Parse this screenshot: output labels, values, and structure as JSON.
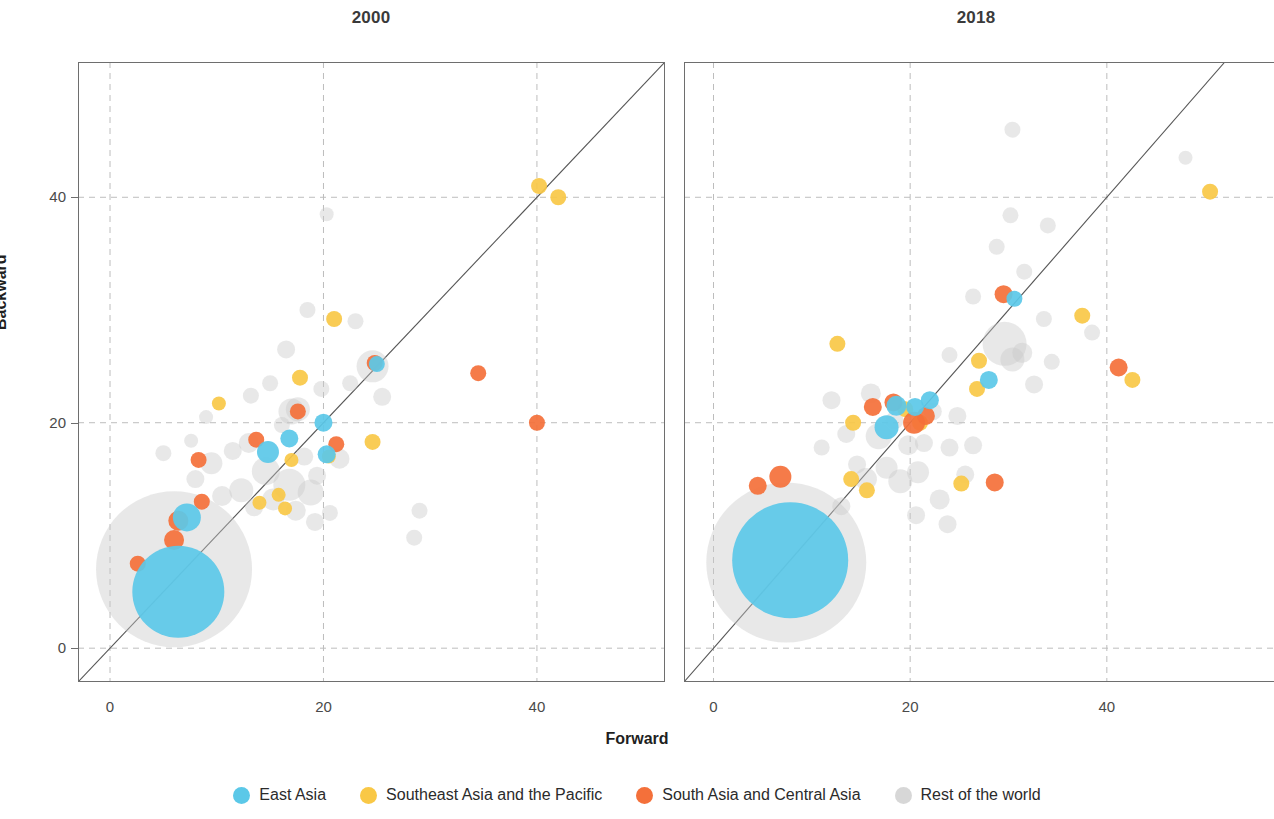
{
  "figure": {
    "xlabel": "Forward",
    "ylabel": "Backward"
  },
  "panels": [
    {
      "key": "p2000",
      "title": "2000"
    },
    {
      "key": "p2018",
      "title": "2018"
    }
  ],
  "legend": {
    "items": [
      {
        "label": "East Asia",
        "color": "#5BC8E8",
        "icon": "circle-marker-icon"
      },
      {
        "label": "Southeast Asia and the Pacific",
        "color": "#F9C846",
        "icon": "circle-marker-icon"
      },
      {
        "label": "South Asia and Central Asia",
        "color": "#F4703A",
        "icon": "circle-marker-icon"
      },
      {
        "label": "Rest of the world",
        "color": "#C9C9C9",
        "icon": "circle-marker-icon"
      }
    ]
  },
  "axis_ticks": {
    "x": [
      "0",
      "20",
      "40"
    ],
    "y": [
      "0",
      "20",
      "40"
    ]
  },
  "chart_data": {
    "type": "scatter",
    "xlabel": "Forward",
    "ylabel": "Backward",
    "grid": true,
    "legend_position": "bottom",
    "marker_encoding": "bubble size = economy size; color = region",
    "reference_line": {
      "type": "identity",
      "equation": "y = x",
      "color": "#555555"
    },
    "colors": {
      "East Asia": "#5BC8E8",
      "Southeast Asia and the Pacific": "#F9C846",
      "South Asia and Central Asia": "#F4703A",
      "Rest of the world": "#C9C9C9"
    },
    "panels": [
      {
        "title": "2000",
        "xlim": [
          -3,
          52
        ],
        "ylim": [
          -3,
          52
        ],
        "xticks": [
          0,
          20,
          40
        ],
        "yticks": [
          0,
          20,
          40
        ],
        "points": [
          {
            "region": "East Asia",
            "x": 6.4,
            "y": 5.0,
            "r": 46
          },
          {
            "region": "East Asia",
            "x": 7.2,
            "y": 11.6,
            "r": 14
          },
          {
            "region": "East Asia",
            "x": 14.8,
            "y": 17.4,
            "r": 11
          },
          {
            "region": "East Asia",
            "x": 16.8,
            "y": 18.6,
            "r": 9
          },
          {
            "region": "East Asia",
            "x": 20.0,
            "y": 20.0,
            "r": 9
          },
          {
            "region": "East Asia",
            "x": 20.3,
            "y": 17.2,
            "r": 9
          },
          {
            "region": "East Asia",
            "x": 25.0,
            "y": 25.2,
            "r": 8
          },
          {
            "region": "Southeast Asia and the Pacific",
            "x": 10.2,
            "y": 21.7,
            "r": 7
          },
          {
            "region": "Southeast Asia and the Pacific",
            "x": 14.0,
            "y": 12.9,
            "r": 7
          },
          {
            "region": "Southeast Asia and the Pacific",
            "x": 15.8,
            "y": 13.6,
            "r": 7
          },
          {
            "region": "Southeast Asia and the Pacific",
            "x": 16.4,
            "y": 12.4,
            "r": 7
          },
          {
            "region": "Southeast Asia and the Pacific",
            "x": 17.0,
            "y": 16.7,
            "r": 7
          },
          {
            "region": "Southeast Asia and the Pacific",
            "x": 17.8,
            "y": 24.0,
            "r": 8
          },
          {
            "region": "Southeast Asia and the Pacific",
            "x": 20.5,
            "y": 17.0,
            "r": 7
          },
          {
            "region": "Southeast Asia and the Pacific",
            "x": 21.0,
            "y": 29.2,
            "r": 8
          },
          {
            "region": "Southeast Asia and the Pacific",
            "x": 24.6,
            "y": 18.3,
            "r": 8
          },
          {
            "region": "Southeast Asia and the Pacific",
            "x": 40.2,
            "y": 41.0,
            "r": 8
          },
          {
            "region": "Southeast Asia and the Pacific",
            "x": 42.0,
            "y": 40.0,
            "r": 8
          },
          {
            "region": "South Asia and Central Asia",
            "x": 2.6,
            "y": 7.5,
            "r": 8
          },
          {
            "region": "South Asia and Central Asia",
            "x": 6.0,
            "y": 9.6,
            "r": 10
          },
          {
            "region": "South Asia and Central Asia",
            "x": 6.4,
            "y": 11.3,
            "r": 10
          },
          {
            "region": "South Asia and Central Asia",
            "x": 8.6,
            "y": 13.0,
            "r": 8
          },
          {
            "region": "South Asia and Central Asia",
            "x": 8.3,
            "y": 16.7,
            "r": 8
          },
          {
            "region": "South Asia and Central Asia",
            "x": 13.7,
            "y": 18.5,
            "r": 8
          },
          {
            "region": "South Asia and Central Asia",
            "x": 17.6,
            "y": 21.0,
            "r": 8
          },
          {
            "region": "South Asia and Central Asia",
            "x": 21.2,
            "y": 18.1,
            "r": 8
          },
          {
            "region": "South Asia and Central Asia",
            "x": 24.8,
            "y": 25.3,
            "r": 8
          },
          {
            "region": "South Asia and Central Asia",
            "x": 34.5,
            "y": 24.4,
            "r": 8
          },
          {
            "region": "South Asia and Central Asia",
            "x": 40.0,
            "y": 20.0,
            "r": 8
          },
          {
            "region": "Rest of the world",
            "x": 6.0,
            "y": 7.0,
            "r": 78
          },
          {
            "region": "Rest of the world",
            "x": 5.0,
            "y": 17.3,
            "r": 8
          },
          {
            "region": "Rest of the world",
            "x": 8.0,
            "y": 15.0,
            "r": 9
          },
          {
            "region": "Rest of the world",
            "x": 9.5,
            "y": 16.4,
            "r": 11
          },
          {
            "region": "Rest of the world",
            "x": 10.5,
            "y": 13.5,
            "r": 10
          },
          {
            "region": "Rest of the world",
            "x": 11.5,
            "y": 17.5,
            "r": 9
          },
          {
            "region": "Rest of the world",
            "x": 12.3,
            "y": 14.0,
            "r": 12
          },
          {
            "region": "Rest of the world",
            "x": 13.0,
            "y": 18.2,
            "r": 10
          },
          {
            "region": "Rest of the world",
            "x": 13.5,
            "y": 12.5,
            "r": 9
          },
          {
            "region": "Rest of the world",
            "x": 14.6,
            "y": 15.7,
            "r": 14
          },
          {
            "region": "Rest of the world",
            "x": 15.3,
            "y": 13.2,
            "r": 11
          },
          {
            "region": "Rest of the world",
            "x": 16.1,
            "y": 19.8,
            "r": 8
          },
          {
            "region": "Rest of the world",
            "x": 16.8,
            "y": 14.5,
            "r": 16
          },
          {
            "region": "Rest of the world",
            "x": 17.4,
            "y": 12.2,
            "r": 10
          },
          {
            "region": "Rest of the world",
            "x": 18.2,
            "y": 17.0,
            "r": 9
          },
          {
            "region": "Rest of the world",
            "x": 18.8,
            "y": 13.8,
            "r": 13
          },
          {
            "region": "Rest of the world",
            "x": 19.4,
            "y": 15.3,
            "r": 9
          },
          {
            "region": "Rest of the world",
            "x": 13.2,
            "y": 22.4,
            "r": 8
          },
          {
            "region": "Rest of the world",
            "x": 15.0,
            "y": 23.5,
            "r": 8
          },
          {
            "region": "Rest of the world",
            "x": 16.5,
            "y": 26.5,
            "r": 9
          },
          {
            "region": "Rest of the world",
            "x": 18.5,
            "y": 30.0,
            "r": 8
          },
          {
            "region": "Rest of the world",
            "x": 20.3,
            "y": 38.5,
            "r": 7
          },
          {
            "region": "Rest of the world",
            "x": 17.6,
            "y": 21.2,
            "r": 12
          },
          {
            "region": "Rest of the world",
            "x": 19.8,
            "y": 23.0,
            "r": 8
          },
          {
            "region": "Rest of the world",
            "x": 21.5,
            "y": 16.8,
            "r": 10
          },
          {
            "region": "Rest of the world",
            "x": 22.5,
            "y": 23.5,
            "r": 8
          },
          {
            "region": "Rest of the world",
            "x": 23.0,
            "y": 29.0,
            "r": 8
          },
          {
            "region": "Rest of the world",
            "x": 24.6,
            "y": 25.0,
            "r": 16
          },
          {
            "region": "Rest of the world",
            "x": 25.5,
            "y": 22.3,
            "r": 9
          },
          {
            "region": "Rest of the world",
            "x": 17.0,
            "y": 21.0,
            "r": 13
          },
          {
            "region": "Rest of the world",
            "x": 29.0,
            "y": 12.2,
            "r": 8
          },
          {
            "region": "Rest of the world",
            "x": 28.5,
            "y": 9.8,
            "r": 8
          },
          {
            "region": "Rest of the world",
            "x": 9.0,
            "y": 20.5,
            "r": 7
          },
          {
            "region": "Rest of the world",
            "x": 7.6,
            "y": 18.4,
            "r": 7
          },
          {
            "region": "Rest of the world",
            "x": 19.2,
            "y": 11.2,
            "r": 9
          },
          {
            "region": "Rest of the world",
            "x": 20.6,
            "y": 12.0,
            "r": 8
          }
        ]
      },
      {
        "title": "2018",
        "xlim": [
          -3,
          57
        ],
        "ylim": [
          -3,
          52
        ],
        "xticks": [
          0,
          20,
          40
        ],
        "yticks": [
          0,
          20,
          40
        ],
        "points": [
          {
            "region": "East Asia",
            "x": 7.8,
            "y": 7.8,
            "r": 58
          },
          {
            "region": "East Asia",
            "x": 17.6,
            "y": 19.6,
            "r": 12
          },
          {
            "region": "East Asia",
            "x": 18.6,
            "y": 21.5,
            "r": 10
          },
          {
            "region": "East Asia",
            "x": 20.5,
            "y": 21.4,
            "r": 9
          },
          {
            "region": "East Asia",
            "x": 22.0,
            "y": 22.0,
            "r": 9
          },
          {
            "region": "East Asia",
            "x": 28.0,
            "y": 23.8,
            "r": 9
          },
          {
            "region": "East Asia",
            "x": 30.6,
            "y": 31.0,
            "r": 8
          },
          {
            "region": "Southeast Asia and the Pacific",
            "x": 12.6,
            "y": 27.0,
            "r": 8
          },
          {
            "region": "Southeast Asia and the Pacific",
            "x": 14.2,
            "y": 20.0,
            "r": 8
          },
          {
            "region": "Southeast Asia and the Pacific",
            "x": 14.0,
            "y": 15.0,
            "r": 8
          },
          {
            "region": "Southeast Asia and the Pacific",
            "x": 15.6,
            "y": 14.0,
            "r": 8
          },
          {
            "region": "Southeast Asia and the Pacific",
            "x": 19.5,
            "y": 21.2,
            "r": 8
          },
          {
            "region": "Southeast Asia and the Pacific",
            "x": 21.0,
            "y": 20.0,
            "r": 8
          },
          {
            "region": "Southeast Asia and the Pacific",
            "x": 25.2,
            "y": 14.6,
            "r": 8
          },
          {
            "region": "Southeast Asia and the Pacific",
            "x": 26.8,
            "y": 23.0,
            "r": 8
          },
          {
            "region": "Southeast Asia and the Pacific",
            "x": 27.0,
            "y": 25.5,
            "r": 8
          },
          {
            "region": "Southeast Asia and the Pacific",
            "x": 37.5,
            "y": 29.5,
            "r": 8
          },
          {
            "region": "Southeast Asia and the Pacific",
            "x": 42.6,
            "y": 23.8,
            "r": 8
          },
          {
            "region": "Southeast Asia and the Pacific",
            "x": 50.5,
            "y": 40.5,
            "r": 8
          },
          {
            "region": "South Asia and Central Asia",
            "x": 4.5,
            "y": 14.4,
            "r": 9
          },
          {
            "region": "South Asia and Central Asia",
            "x": 6.8,
            "y": 15.2,
            "r": 11
          },
          {
            "region": "South Asia and Central Asia",
            "x": 16.2,
            "y": 21.4,
            "r": 9
          },
          {
            "region": "South Asia and Central Asia",
            "x": 18.3,
            "y": 21.8,
            "r": 9
          },
          {
            "region": "South Asia and Central Asia",
            "x": 20.4,
            "y": 20.0,
            "r": 11
          },
          {
            "region": "South Asia and Central Asia",
            "x": 21.6,
            "y": 20.6,
            "r": 9
          },
          {
            "region": "South Asia and Central Asia",
            "x": 28.6,
            "y": 14.7,
            "r": 9
          },
          {
            "region": "South Asia and Central Asia",
            "x": 29.5,
            "y": 31.4,
            "r": 9
          },
          {
            "region": "South Asia and Central Asia",
            "x": 41.2,
            "y": 24.9,
            "r": 9
          },
          {
            "region": "Rest of the world",
            "x": 7.4,
            "y": 7.6,
            "r": 80
          },
          {
            "region": "Rest of the world",
            "x": 13.5,
            "y": 19.0,
            "r": 9
          },
          {
            "region": "Rest of the world",
            "x": 14.6,
            "y": 16.3,
            "r": 9
          },
          {
            "region": "Rest of the world",
            "x": 15.5,
            "y": 15.0,
            "r": 11
          },
          {
            "region": "Rest of the world",
            "x": 16.0,
            "y": 22.6,
            "r": 10
          },
          {
            "region": "Rest of the world",
            "x": 16.8,
            "y": 18.8,
            "r": 13
          },
          {
            "region": "Rest of the world",
            "x": 17.6,
            "y": 16.0,
            "r": 11
          },
          {
            "region": "Rest of the world",
            "x": 18.4,
            "y": 20.2,
            "r": 9
          },
          {
            "region": "Rest of the world",
            "x": 19.0,
            "y": 14.8,
            "r": 12
          },
          {
            "region": "Rest of the world",
            "x": 19.8,
            "y": 18.0,
            "r": 10
          },
          {
            "region": "Rest of the world",
            "x": 20.8,
            "y": 15.6,
            "r": 11
          },
          {
            "region": "Rest of the world",
            "x": 21.4,
            "y": 18.2,
            "r": 9
          },
          {
            "region": "Rest of the world",
            "x": 22.3,
            "y": 21.0,
            "r": 9
          },
          {
            "region": "Rest of the world",
            "x": 23.0,
            "y": 13.2,
            "r": 10
          },
          {
            "region": "Rest of the world",
            "x": 24.0,
            "y": 17.8,
            "r": 9
          },
          {
            "region": "Rest of the world",
            "x": 24.8,
            "y": 20.6,
            "r": 9
          },
          {
            "region": "Rest of the world",
            "x": 25.6,
            "y": 15.4,
            "r": 9
          },
          {
            "region": "Rest of the world",
            "x": 26.4,
            "y": 18.0,
            "r": 9
          },
          {
            "region": "Rest of the world",
            "x": 29.6,
            "y": 27.0,
            "r": 22
          },
          {
            "region": "Rest of the world",
            "x": 30.4,
            "y": 25.6,
            "r": 12
          },
          {
            "region": "Rest of the world",
            "x": 31.4,
            "y": 26.2,
            "r": 10
          },
          {
            "region": "Rest of the world",
            "x": 32.6,
            "y": 23.4,
            "r": 9
          },
          {
            "region": "Rest of the world",
            "x": 33.6,
            "y": 29.2,
            "r": 8
          },
          {
            "region": "Rest of the world",
            "x": 31.6,
            "y": 33.4,
            "r": 8
          },
          {
            "region": "Rest of the world",
            "x": 28.8,
            "y": 35.6,
            "r": 8
          },
          {
            "region": "Rest of the world",
            "x": 30.2,
            "y": 38.4,
            "r": 8
          },
          {
            "region": "Rest of the world",
            "x": 30.4,
            "y": 46.0,
            "r": 8
          },
          {
            "region": "Rest of the world",
            "x": 34.0,
            "y": 37.5,
            "r": 8
          },
          {
            "region": "Rest of the world",
            "x": 26.4,
            "y": 31.2,
            "r": 8
          },
          {
            "region": "Rest of the world",
            "x": 24.0,
            "y": 26.0,
            "r": 8
          },
          {
            "region": "Rest of the world",
            "x": 20.6,
            "y": 11.8,
            "r": 9
          },
          {
            "region": "Rest of the world",
            "x": 23.8,
            "y": 11.0,
            "r": 9
          },
          {
            "region": "Rest of the world",
            "x": 34.4,
            "y": 25.4,
            "r": 8
          },
          {
            "region": "Rest of the world",
            "x": 38.5,
            "y": 28.0,
            "r": 8
          },
          {
            "region": "Rest of the world",
            "x": 48.0,
            "y": 43.5,
            "r": 7
          },
          {
            "region": "Rest of the world",
            "x": 13.0,
            "y": 12.6,
            "r": 9
          },
          {
            "region": "Rest of the world",
            "x": 12.0,
            "y": 22.0,
            "r": 9
          },
          {
            "region": "Rest of the world",
            "x": 11.0,
            "y": 17.8,
            "r": 8
          }
        ]
      }
    ]
  }
}
